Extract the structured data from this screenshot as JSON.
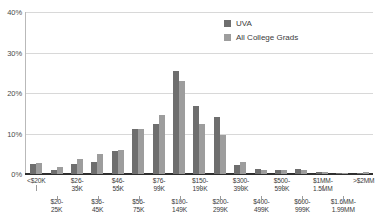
{
  "chart_data": {
    "type": "bar",
    "title": "",
    "subtitle": "",
    "xlabel": "",
    "ylabel": "",
    "ylim": [
      0,
      40
    ],
    "yticks": [
      "0%",
      "10%",
      "20%",
      "30%",
      "40%"
    ],
    "ytick_values": [
      0,
      10,
      20,
      30,
      40
    ],
    "grid": true,
    "legend_position": "top-right",
    "categories": [
      "<$20K",
      "$20-25K",
      "$26-35K",
      "$36-45K",
      "$46-55K",
      "$56-75K",
      "$76-99K",
      "$100-149K",
      "$150-199K",
      "$200-299K",
      "$300-399K",
      "$400-499K",
      "$500-599K",
      "$600-999K",
      "$1MM-1.5MM",
      "$1.6MM-1.99MM",
      ">$2MM"
    ],
    "category_labels_top": [
      "<$20K",
      "$26-35K",
      "$46-55K",
      "$76-99K",
      "$150-199K",
      "$300-399K",
      "$500-599K",
      "$1MM-1.5MM",
      ">$2MM"
    ],
    "category_labels_bottom": [
      "$20-25K",
      "$36-45K",
      "$56-75K",
      "$100-149K",
      "$200-299K",
      "$400-499K",
      "$600-999K",
      "$1.6MM-1.99MM"
    ],
    "series": [
      {
        "name": "UVA",
        "color": "#6e6e6e",
        "values": [
          2.5,
          1.0,
          2.5,
          3.0,
          5.7,
          11.1,
          12.4,
          25.5,
          16.9,
          14.1,
          2.3,
          1.3,
          0.9,
          1.3,
          0.4,
          0.2,
          0.1
        ]
      },
      {
        "name": "All College Grads",
        "color": "#9d9d9d",
        "values": [
          2.8,
          1.8,
          3.6,
          4.9,
          6.0,
          11.2,
          14.6,
          23.0,
          12.4,
          9.7,
          3.0,
          1.1,
          1.0,
          1.0,
          0.6,
          0.2,
          0.4
        ]
      }
    ]
  },
  "legend": {
    "items": [
      {
        "label": "UVA",
        "color": "#6e6e6e"
      },
      {
        "label": "All College Grads",
        "color": "#9d9d9d"
      }
    ]
  },
  "axis": {
    "y_ticks": [
      "40%",
      "30%",
      "20%",
      "10%",
      "0%"
    ]
  }
}
